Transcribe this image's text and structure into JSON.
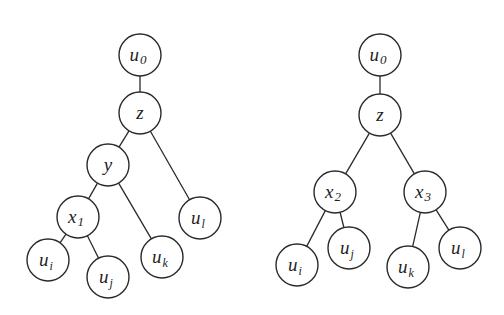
{
  "diagram": {
    "type": "tree-pair",
    "trees": [
      {
        "id": "left-tree",
        "nodes": [
          {
            "id": "u0",
            "base": "u",
            "sub": "0",
            "sub_italic": false,
            "x": 140,
            "y": 55
          },
          {
            "id": "z",
            "base": "z",
            "sub": "",
            "sub_italic": false,
            "x": 140,
            "y": 113
          },
          {
            "id": "y",
            "base": "y",
            "sub": "",
            "sub_italic": false,
            "x": 108,
            "y": 165
          },
          {
            "id": "x1",
            "base": "x",
            "sub": "1",
            "sub_italic": false,
            "x": 78,
            "y": 217
          },
          {
            "id": "ul",
            "base": "u",
            "sub": "l",
            "sub_italic": true,
            "x": 200,
            "y": 218
          },
          {
            "id": "uk",
            "base": "u",
            "sub": "k",
            "sub_italic": true,
            "x": 162,
            "y": 257
          },
          {
            "id": "ui",
            "base": "u",
            "sub": "i",
            "sub_italic": true,
            "x": 48,
            "y": 260
          },
          {
            "id": "uj",
            "base": "u",
            "sub": "j",
            "sub_italic": true,
            "x": 108,
            "y": 277
          }
        ],
        "edges": [
          [
            "u0",
            "z"
          ],
          [
            "z",
            "y"
          ],
          [
            "z",
            "ul"
          ],
          [
            "y",
            "x1"
          ],
          [
            "y",
            "uk"
          ],
          [
            "x1",
            "ui"
          ],
          [
            "x1",
            "uj"
          ]
        ]
      },
      {
        "id": "right-tree",
        "nodes": [
          {
            "id": "u0",
            "base": "u",
            "sub": "0",
            "sub_italic": false,
            "x": 380,
            "y": 55
          },
          {
            "id": "z",
            "base": "z",
            "sub": "",
            "sub_italic": false,
            "x": 380,
            "y": 115
          },
          {
            "id": "x2",
            "base": "x",
            "sub": "2",
            "sub_italic": false,
            "x": 335,
            "y": 192
          },
          {
            "id": "x3",
            "base": "x",
            "sub": "3",
            "sub_italic": false,
            "x": 425,
            "y": 192
          },
          {
            "id": "ui",
            "base": "u",
            "sub": "i",
            "sub_italic": true,
            "x": 297,
            "y": 265
          },
          {
            "id": "uj",
            "base": "u",
            "sub": "j",
            "sub_italic": true,
            "x": 349,
            "y": 248
          },
          {
            "id": "uk",
            "base": "u",
            "sub": "k",
            "sub_italic": true,
            "x": 408,
            "y": 267
          },
          {
            "id": "ul",
            "base": "u",
            "sub": "l",
            "sub_italic": true,
            "x": 460,
            "y": 248
          }
        ],
        "edges": [
          [
            "u0",
            "z"
          ],
          [
            "z",
            "x2"
          ],
          [
            "z",
            "x3"
          ],
          [
            "x2",
            "ui"
          ],
          [
            "x2",
            "uj"
          ],
          [
            "x3",
            "uk"
          ],
          [
            "x3",
            "ul"
          ]
        ]
      }
    ],
    "node_radius": 21,
    "colors": {
      "stroke": "#2a2a2a",
      "fill": "#ffffff",
      "text": "#1e1e1e"
    }
  }
}
